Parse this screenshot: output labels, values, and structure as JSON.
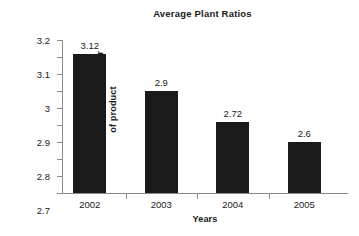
{
  "chart_data": {
    "type": "bar",
    "title": "Average Plant Ratios",
    "xlabel": "Years",
    "ylabel": "Water Use Ratio liters/liter of product",
    "ylabel_lines": [
      "Water Use Ratio liters/liter",
      "of product"
    ],
    "categories": [
      "2002",
      "2003",
      "2004",
      "2005"
    ],
    "values": [
      3.12,
      2.9,
      2.72,
      2.6
    ],
    "value_labels": [
      "3.12",
      "2.9",
      "2.72",
      "2.6"
    ],
    "ylim": [
      2.3,
      3.2
    ],
    "ytick_labels": [
      "3.2",
      "3.1",
      "3",
      "2.9",
      "2.8",
      "2.7",
      "2.6",
      "2.5",
      "2.4",
      "2.3"
    ],
    "ytick_values": [
      3.2,
      3.1,
      3.0,
      2.9,
      2.8,
      2.7,
      2.6,
      2.5,
      2.4,
      2.3
    ],
    "grid": false,
    "legend": false,
    "bar_color": "#1a1a1a",
    "axis_color": "#8a8a8a",
    "text_color": "#1a1a1a",
    "background": "#ffffff"
  }
}
